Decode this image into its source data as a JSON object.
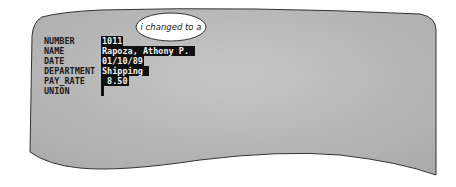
{
  "form": {
    "fields": [
      {
        "label": "NUMBER",
        "value": "1011",
        "width": 16
      },
      {
        "label": "NAME",
        "value": "Rapoza, Athony P.",
        "width": 96
      },
      {
        "label": "DATE",
        "value": "01/10/89",
        "width": 38
      },
      {
        "label": "DEPARTMENT",
        "value": "Shipping",
        "width": 48
      },
      {
        "label": "PAY_RATE",
        "value": " 8.50",
        "width": 24
      },
      {
        "label": "UNION",
        "value": " ",
        "width": 3
      }
    ]
  },
  "callout": {
    "text": "i changed to a"
  },
  "colors": {
    "screen": "#bdbdbd",
    "field_bg": "#111111",
    "field_text": "#f2f2f2"
  }
}
